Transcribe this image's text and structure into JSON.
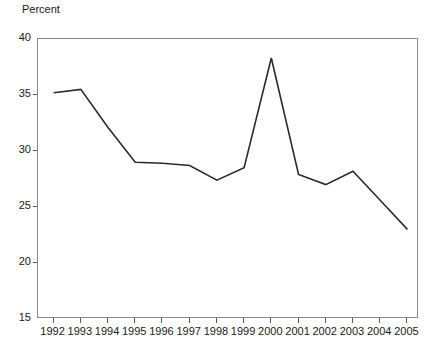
{
  "chart_data": {
    "type": "line",
    "title": "",
    "subtitle": "",
    "xlabel": "",
    "ylabel": "Percent",
    "categories": [
      "1992",
      "1993",
      "1994",
      "1995",
      "1996",
      "1997",
      "1998",
      "1999",
      "2000",
      "2001",
      "2002",
      "2003",
      "2004",
      "2005"
    ],
    "x": [
      1992,
      1993,
      1994,
      1995,
      1996,
      1997,
      1998,
      1999,
      2000,
      2001,
      2002,
      2003,
      2004,
      2005
    ],
    "values": [
      35.2,
      35.5,
      32.1,
      29.0,
      28.9,
      28.7,
      27.4,
      28.5,
      38.3,
      27.9,
      27.0,
      28.2,
      25.6,
      23.0
    ],
    "series": [
      {
        "name": "Percent",
        "values": [
          35.2,
          35.5,
          32.1,
          29.0,
          28.9,
          28.7,
          27.4,
          28.5,
          38.3,
          27.9,
          27.0,
          28.2,
          25.6,
          23.0
        ],
        "color": "#2b2b2b"
      }
    ],
    "ylim": [
      15,
      40
    ],
    "yticks": [
      15,
      20,
      25,
      30,
      35,
      40
    ],
    "ytick_labels": [
      "15",
      "20",
      "25",
      "30",
      "35",
      "40"
    ],
    "xlim": [
      1992,
      2005
    ],
    "grid": false,
    "legend": false,
    "legend_position": "none",
    "annotations": [],
    "line_color": "#2b2b2b",
    "axis_color": "#8a8a8a",
    "background_color": "#ffffff"
  }
}
